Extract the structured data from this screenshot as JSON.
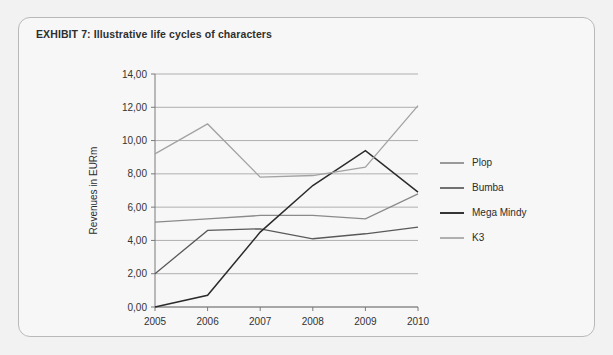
{
  "card": {
    "title": "EXHIBIT 7:  Illustrative life cycles of characters",
    "background": "#f7f7f7",
    "border_color": "#b9b9b9"
  },
  "page": {
    "background": "#f2f2f2"
  },
  "chart_data": {
    "type": "line",
    "title": "",
    "xlabel": "",
    "ylabel": "Revenues in EURm",
    "categories": [
      "2005",
      "2006",
      "2007",
      "2008",
      "2009",
      "2010"
    ],
    "x": [
      2005,
      2006,
      2007,
      2008,
      2009,
      2010
    ],
    "ylim": [
      0,
      14
    ],
    "yticks": [
      0,
      2,
      4,
      6,
      8,
      10,
      12,
      14
    ],
    "ytick_labels": [
      "0,00",
      "2,00",
      "4,00",
      "6,00",
      "8,00",
      "10,00",
      "12,00",
      "14,00"
    ],
    "grid": true,
    "legend_position": "right",
    "series": [
      {
        "name": "Plop",
        "color": "#8a8a8a",
        "width": 1.3,
        "values": [
          5.1,
          5.3,
          5.5,
          5.5,
          5.3,
          6.8
        ]
      },
      {
        "name": "Bumba",
        "color": "#595959",
        "width": 1.3,
        "values": [
          2.0,
          4.6,
          4.7,
          4.1,
          4.4,
          4.8
        ]
      },
      {
        "name": "Mega Mindy",
        "color": "#2b2b2b",
        "width": 1.5,
        "values": [
          0.0,
          0.7,
          4.5,
          7.3,
          9.4,
          6.9
        ]
      },
      {
        "name": "K3",
        "color": "#a3a3a3",
        "width": 1.3,
        "values": [
          9.2,
          11.0,
          7.8,
          7.9,
          8.4,
          12.1
        ]
      }
    ]
  },
  "legend": {
    "entries": [
      {
        "label": "Plop"
      },
      {
        "label": "Bumba"
      },
      {
        "label": "Mega Mindy"
      },
      {
        "label": "K3"
      }
    ]
  }
}
